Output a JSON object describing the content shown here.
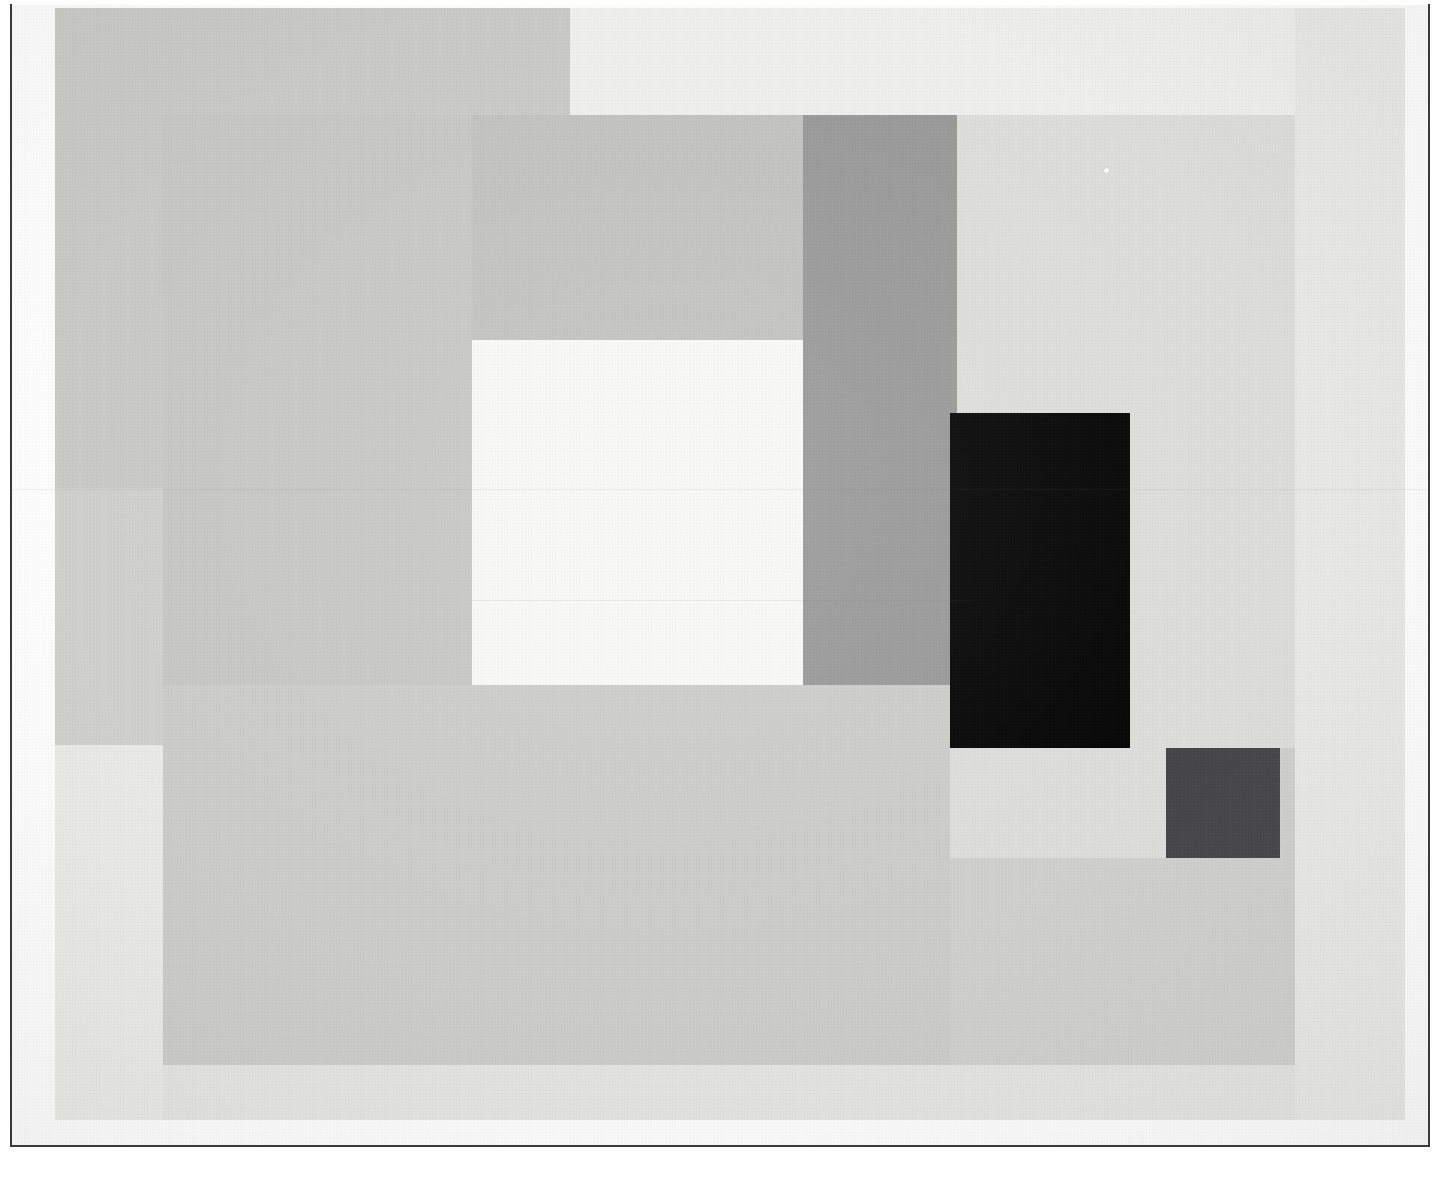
{
  "artwork": {
    "title": "Geometric Abstract Relief Composition",
    "medium_note": "photographic reproduction on textured paper",
    "palette": {
      "paper_white": "#fdfdfd",
      "near_white": "#f6f6f4",
      "pale_gray": "#eeeeec",
      "light_gray": "#e3e3e1",
      "light_gray_warm": "#dedede",
      "mid_light_gray": "#d6d6d4",
      "mid_gray": "#cacaca",
      "mid_gray_dark": "#c4c4c2",
      "medium_gray": "#bdbdbd",
      "steel_gray": "#989898",
      "dark_gray": "#454547",
      "black": "#060606",
      "frame_rule": "#3a3a3c"
    },
    "blocks": [
      {
        "name": "ground-field",
        "label": "Background ground field",
        "color": "#cfcfcd",
        "x": 55,
        "y": 8,
        "w": 1350,
        "h": 1112
      },
      {
        "name": "upper-left-warm-panel",
        "label": "Upper left warm gray panel",
        "color": "#c8c8c6",
        "x": 55,
        "y": 8,
        "w": 515,
        "h": 480
      },
      {
        "name": "top-pale-band",
        "label": "Top pale horizontal band",
        "color": "#eeeeec",
        "x": 570,
        "y": 8,
        "w": 725,
        "h": 108
      },
      {
        "name": "upper-right-pale-field",
        "label": "Upper right pale field",
        "color": "#e8e8e6",
        "x": 1295,
        "y": 8,
        "w": 110,
        "h": 1112
      },
      {
        "name": "left-tall-column",
        "label": "Left tall gray column",
        "color": "#c6c6c4",
        "x": 163,
        "y": 115,
        "w": 309,
        "h": 950
      },
      {
        "name": "center-gray-panel",
        "label": "Center gray panel",
        "color": "#c1c1bf",
        "x": 472,
        "y": 115,
        "w": 331,
        "h": 740
      },
      {
        "name": "center-white-rectangle",
        "label": "Center white rectangle",
        "color": "#f7f7f5",
        "x": 472,
        "y": 340,
        "w": 331,
        "h": 345
      },
      {
        "name": "steel-gray-column",
        "label": "Tall steel gray column",
        "color": "#989898",
        "x": 803,
        "y": 115,
        "w": 154,
        "h": 570
      },
      {
        "name": "right-light-panel",
        "label": "Right light gray panel",
        "color": "#dcdcda",
        "x": 957,
        "y": 115,
        "w": 338,
        "h": 633
      },
      {
        "name": "black-rectangle",
        "label": "Black vertical rectangle",
        "color": "#060606",
        "x": 950,
        "y": 413,
        "w": 180,
        "h": 335
      },
      {
        "name": "lower-center-field",
        "label": "Lower center broad field",
        "color": "#cbcbc9",
        "x": 163,
        "y": 685,
        "w": 787,
        "h": 380
      },
      {
        "name": "lower-left-pale-block",
        "label": "Lower left pale block",
        "color": "#e9e9e7",
        "x": 55,
        "y": 745,
        "w": 108,
        "h": 375
      },
      {
        "name": "lower-right-pale-band",
        "label": "Lower right pale horizontal band",
        "color": "#dcdcda",
        "x": 950,
        "y": 748,
        "w": 216,
        "h": 110
      },
      {
        "name": "dark-gray-square",
        "label": "Dark gray square",
        "color": "#454547",
        "x": 1166,
        "y": 748,
        "w": 114,
        "h": 110
      },
      {
        "name": "bottom-pale-sweep",
        "label": "Bottom pale sweep",
        "color": "#e4e4e2",
        "x": 163,
        "y": 1065,
        "w": 1132,
        "h": 55
      }
    ],
    "artifacts": {
      "seams": [
        {
          "name": "upper-seam",
          "x": 12,
          "y": 489,
          "w": 1416
        },
        {
          "name": "lower-seam",
          "x": 472,
          "y": 600,
          "w": 500
        }
      ],
      "speck": {
        "name": "dust-speck",
        "x": 1104,
        "y": 168
      }
    },
    "frame": {
      "left_rule": "vertical rule left margin",
      "bottom_rule": "horizontal rule bottom margin",
      "right_rule": "vertical rule right margin"
    }
  }
}
